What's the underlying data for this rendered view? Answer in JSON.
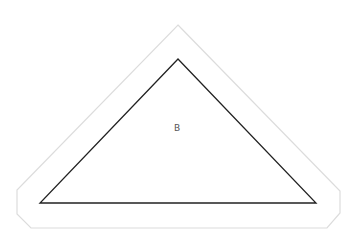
{
  "diagram": {
    "outer_outline": {
      "points": "178,25 340,191 340,213 327,228 31,228 17,214 17,190",
      "stroke": "#dcdcdc",
      "stroke_width": 1.2
    },
    "triangle": {
      "points": "178,59 316,203 40,203",
      "stroke": "#222222",
      "stroke_width": 1.3
    },
    "label": {
      "text": "B",
      "x": 177,
      "y": 131,
      "color": "#555555"
    }
  }
}
